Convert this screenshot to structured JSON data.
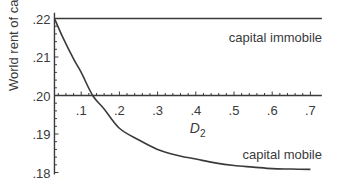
{
  "chart_data": {
    "type": "line",
    "title": "",
    "xlabel": "D2",
    "xlabel_main": "D",
    "xlabel_sub": "2",
    "ylabel": "World rent of capital",
    "xlim": [
      0.03,
      0.73
    ],
    "ylim": [
      0.18,
      0.22
    ],
    "x_ticks": [
      ".1",
      ".2",
      ".3",
      ".4",
      ".5",
      ".6",
      ".7"
    ],
    "x_tick_values": [
      0.1,
      0.2,
      0.3,
      0.4,
      0.5,
      0.6,
      0.7
    ],
    "y_ticks": [
      ".22",
      ".21",
      ".20",
      ".19",
      ".18"
    ],
    "y_tick_values": [
      0.22,
      0.21,
      0.2,
      0.19,
      0.18
    ],
    "x_axis_crosses_y_at": 0.2,
    "grid": false,
    "series": [
      {
        "name": "capital immobile",
        "x": [
          0.03,
          0.73
        ],
        "y": [
          0.22,
          0.22
        ]
      },
      {
        "name": "capital mobile",
        "x": [
          0.03,
          0.05,
          0.08,
          0.1,
          0.13,
          0.16,
          0.2,
          0.25,
          0.3,
          0.35,
          0.4,
          0.45,
          0.5,
          0.55,
          0.6,
          0.65,
          0.7
        ],
        "y": [
          0.22,
          0.2155,
          0.2095,
          0.206,
          0.2,
          0.1965,
          0.1915,
          0.1885,
          0.186,
          0.1845,
          0.1835,
          0.1825,
          0.1818,
          0.1814,
          0.181,
          0.1809,
          0.1808
        ]
      }
    ],
    "annotations": [
      "capital immobile",
      "capital mobile"
    ]
  }
}
